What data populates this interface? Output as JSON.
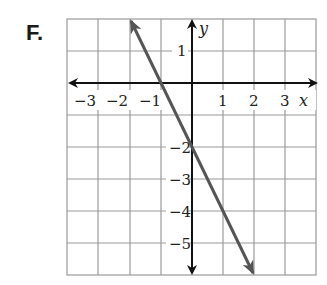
{
  "problem_label": "F.",
  "graph": {
    "x_axis_label": "x",
    "y_axis_label": "y",
    "x_ticks": [
      "−3",
      "−2",
      "−1",
      "1",
      "2",
      "3"
    ],
    "y_ticks": [
      "1",
      "−2",
      "−3",
      "−4",
      "−5"
    ],
    "x_range": [
      -4,
      4
    ],
    "y_range": [
      -6,
      2
    ],
    "line": {
      "equation": "y = -2x - 2",
      "from": [
        -2,
        2
      ],
      "to": [
        2,
        -6
      ],
      "color": "#555555"
    },
    "grid_color": "#9a9a9a",
    "axis_color": "#111111"
  }
}
